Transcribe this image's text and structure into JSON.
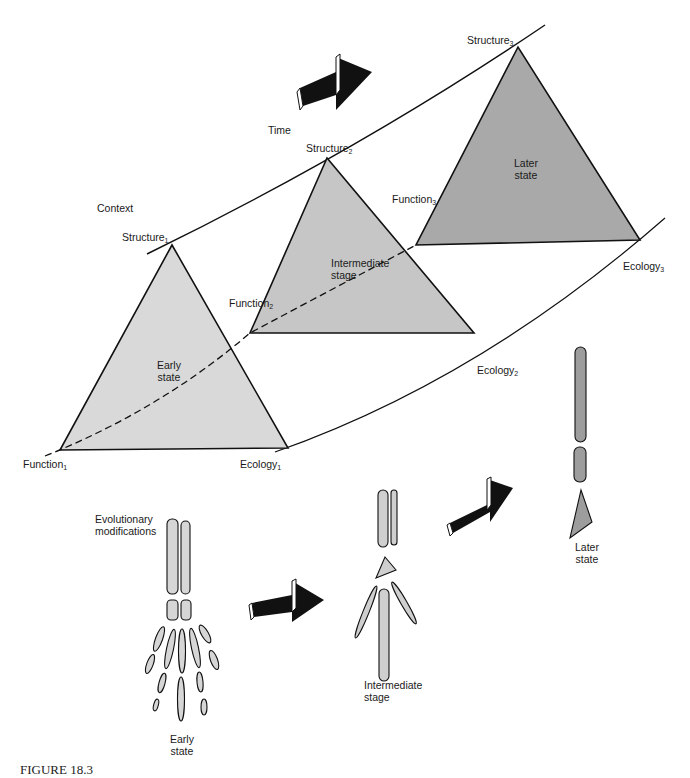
{
  "figure": {
    "caption_visible": "FIGURE 18.3",
    "context_label": "Context",
    "time_label": "Time",
    "colors": {
      "early_fill": "#d9d9d9",
      "intermediate_fill": "#c6c6c6",
      "later_fill": "#a9a9a9",
      "bone_fill": "#cfcfcf",
      "later_bone_fill": "#9d9d9d",
      "stroke": "#111111"
    },
    "triangles": [
      {
        "name": "Early state",
        "line1": "Early",
        "line2": "state",
        "structure": "Structure",
        "structure_sub": "1",
        "function": "Function",
        "function_sub": "1",
        "ecology": "Ecology",
        "ecology_sub": "1"
      },
      {
        "name": "Intermediate stage",
        "line1": "Intermediate",
        "line2": "stage",
        "structure": "Structure",
        "structure_sub": "2",
        "function": "Function",
        "function_sub": "2",
        "ecology": "Ecology",
        "ecology_sub": "2"
      },
      {
        "name": "Later state",
        "line1": "Later",
        "line2": "state",
        "structure": "Structure",
        "structure_sub": "3",
        "function": "Function",
        "function_sub": "3",
        "ecology": "Ecology",
        "ecology_sub": "3"
      }
    ],
    "bones": {
      "heading_line1": "Evolutionary",
      "heading_line2": "modifications",
      "early_line1": "Early",
      "early_line2": "state",
      "intermediate_line1": "Intermediate",
      "intermediate_line2": "stage",
      "later_line1": "Later",
      "later_line2": "state"
    }
  }
}
